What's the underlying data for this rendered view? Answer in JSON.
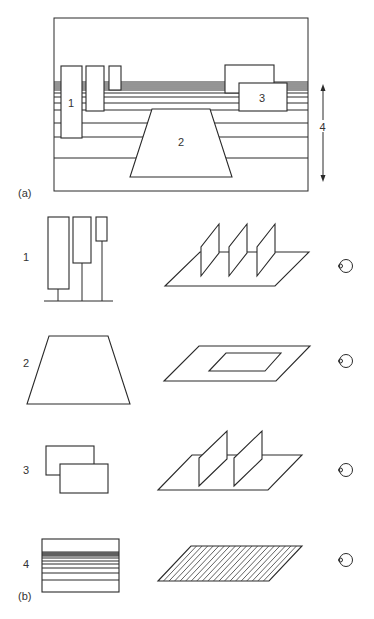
{
  "figure": {
    "part_a": {
      "label": "(a)",
      "frame": {
        "x": 54,
        "y": 18,
        "w": 254,
        "h": 173
      },
      "horizon_lines_y": [
        82,
        84,
        86,
        88,
        90,
        93,
        97,
        103,
        110,
        123,
        137,
        158
      ],
      "element_1": {
        "label": "1",
        "rects": [
          [
            61,
            66,
            21,
            72
          ],
          [
            86,
            66,
            18,
            45
          ],
          [
            109,
            66,
            12,
            24
          ]
        ]
      },
      "element_2": {
        "label": "2",
        "points": "152,109 210,109 232,177 130,177"
      },
      "element_3": {
        "label": "3",
        "rects": [
          [
            225,
            65,
            49,
            28
          ],
          [
            239,
            83,
            48,
            28
          ]
        ]
      },
      "element_4": {
        "label": "4",
        "arrow": {
          "x": 323,
          "y1": 85,
          "y2": 181
        }
      }
    },
    "part_b": {
      "label": "(b)",
      "rows": [
        {
          "label": "1",
          "description": "vertical panels on ground plane"
        },
        {
          "label": "2",
          "description": "trapezoid as flat plane on ground"
        },
        {
          "label": "3",
          "description": "overlapping rectangles as vertical planes"
        },
        {
          "label": "4",
          "description": "horizontal lines as textured ground plane"
        }
      ]
    },
    "icons": {
      "eye": "eye-icon (side view circle)"
    }
  }
}
